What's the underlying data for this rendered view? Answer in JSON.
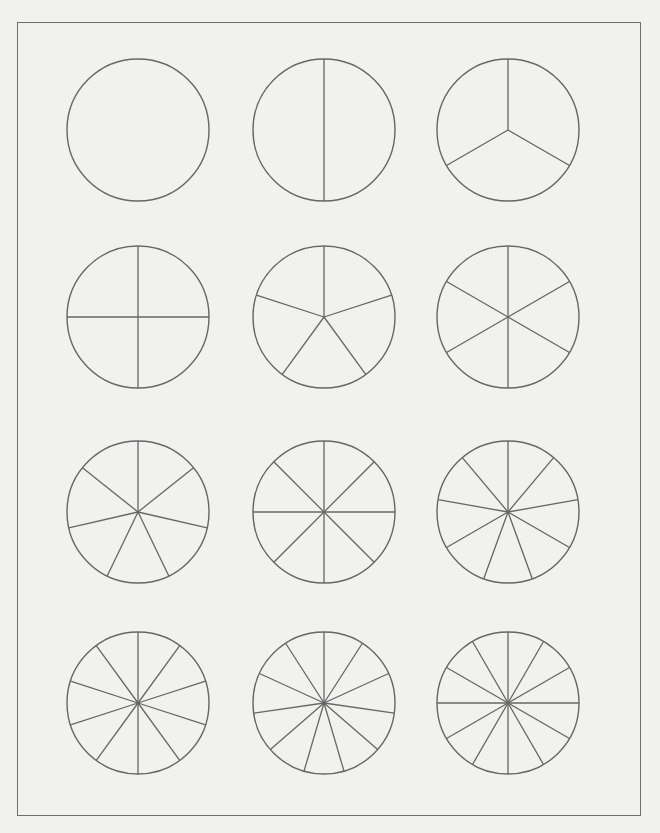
{
  "colors": {
    "background": "#f1f1f0",
    "stroke": "#666666",
    "frame": "#6e6e6e"
  },
  "layout": {
    "columns_x": [
      138,
      324,
      508
    ],
    "rows_y": [
      130,
      317,
      512,
      703
    ],
    "radius": 71
  },
  "circles": [
    {
      "parts": 1
    },
    {
      "parts": 2
    },
    {
      "parts": 3
    },
    {
      "parts": 4
    },
    {
      "parts": 5
    },
    {
      "parts": 6
    },
    {
      "parts": 7
    },
    {
      "parts": 8
    },
    {
      "parts": 9
    },
    {
      "parts": 10
    },
    {
      "parts": 11
    },
    {
      "parts": 12
    }
  ]
}
